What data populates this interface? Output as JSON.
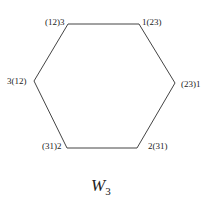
{
  "diagram": {
    "type": "hexagon",
    "vertices": [
      {
        "id": "top-left",
        "label": "(12)3"
      },
      {
        "id": "top-right",
        "label": "1(23)"
      },
      {
        "id": "right",
        "label": "(23)1"
      },
      {
        "id": "bottom-right",
        "label": "2(31)"
      },
      {
        "id": "bottom-left",
        "label": "(31)2"
      },
      {
        "id": "left",
        "label": "3(12)"
      }
    ],
    "caption": {
      "main": "W",
      "sub": "3"
    },
    "line_color": "#444444"
  }
}
